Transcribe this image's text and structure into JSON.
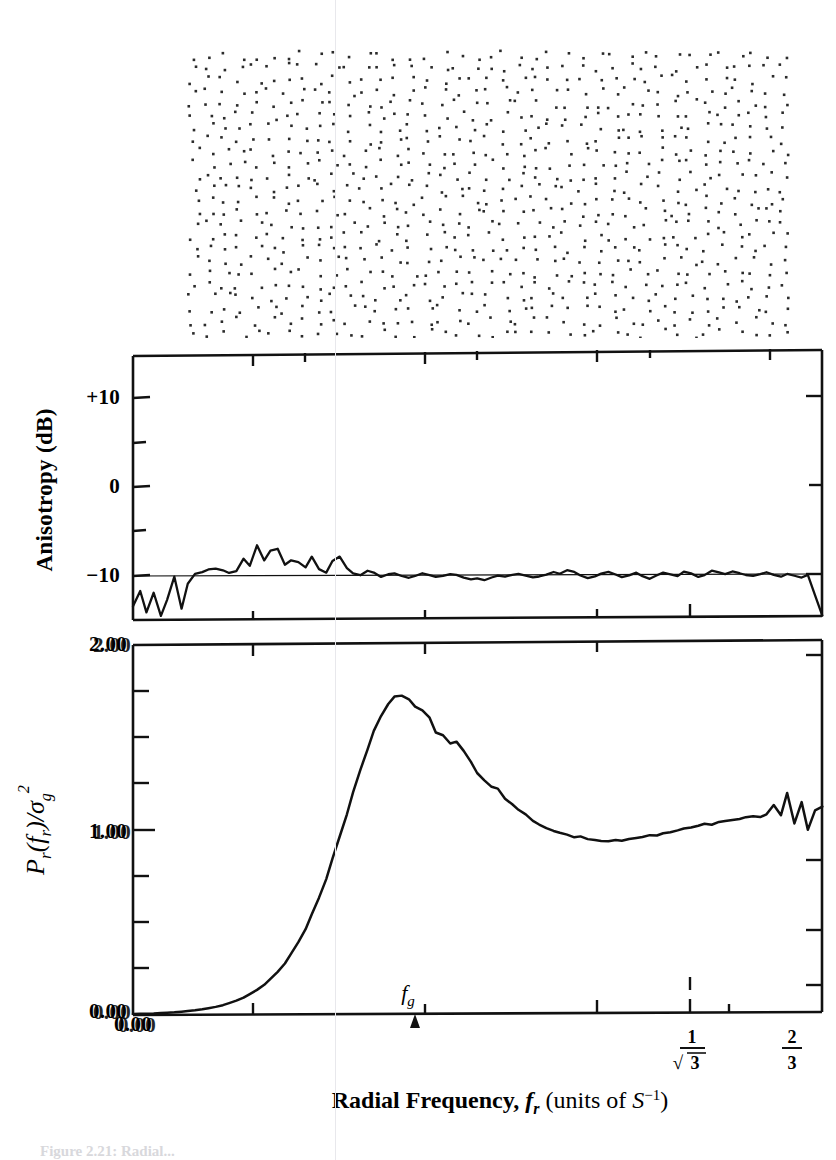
{
  "figure": {
    "caption": "Figure 2.21: Radial...",
    "stipple_panel_name": "jittered-sample-point-pattern"
  },
  "anisotropy_plot": {
    "ylabel": "Anisotropy (dB)",
    "ytick_labels": [
      "+10",
      "0",
      "−10"
    ]
  },
  "spectrum_plot": {
    "ylabel_numerator": "P",
    "ylabel_sub1": "r",
    "ylabel_arg": "(f",
    "ylabel_sub2": "r",
    "ylabel_close": ")/",
    "ylabel_sigma": "σ",
    "ylabel_sigma_sub": "g",
    "ylabel_sigma_sup": "2",
    "ytick_labels": [
      "2.00",
      "1.00",
      "0.00"
    ],
    "marker_label": "f",
    "marker_label_sub": "g",
    "xtick_origin": "0.00",
    "xtick_sqrt3_num": "1",
    "xtick_sqrt3_den": "3",
    "xtick_sqrt3_radical": "√",
    "xtick_twothirds_num": "2",
    "xtick_twothirds_den": "3"
  },
  "xaxis": {
    "label_main": "Radial Frequency, ",
    "label_f": "f",
    "label_f_sub": "r",
    "label_units_open": " (units of ",
    "label_units_S": "S",
    "label_units_sup": "−1",
    "label_units_close": ")"
  },
  "colors": {
    "ink": "#111111",
    "stipple": "#2b2b2b",
    "guide": "#e8e8ec"
  },
  "chart_data": [
    {
      "type": "scatter",
      "name": "jittered-point-pattern",
      "title": "",
      "xlabel": "",
      "ylabel": "",
      "xlim": [
        0,
        1
      ],
      "ylim": [
        0,
        1
      ],
      "grid": false,
      "n_points": 900,
      "description": "Jittered (blue-noise) sample point distribution, roughly uniform density with local regularity"
    },
    {
      "type": "line",
      "name": "anisotropy-spectrum",
      "title": "",
      "xlabel": "Radial Frequency, f_r (units of S^-1)",
      "ylabel": "Anisotropy (dB)",
      "xlim": [
        0,
        0.6667
      ],
      "ylim": [
        -15,
        14
      ],
      "yticks": [
        10,
        5,
        0,
        -5,
        -10
      ],
      "ytick_labels": [
        "+10",
        "",
        "0",
        "",
        "−10"
      ],
      "grid": false,
      "reference_line_y": -10,
      "x": [
        0.0,
        0.007,
        0.013,
        0.02,
        0.027,
        0.033,
        0.04,
        0.047,
        0.053,
        0.06,
        0.067,
        0.073,
        0.08,
        0.087,
        0.093,
        0.1,
        0.107,
        0.113,
        0.12,
        0.127,
        0.133,
        0.14,
        0.147,
        0.153,
        0.16,
        0.167,
        0.173,
        0.18,
        0.187,
        0.193,
        0.2,
        0.207,
        0.213,
        0.22,
        0.227,
        0.233,
        0.24,
        0.247,
        0.253,
        0.26,
        0.267,
        0.273,
        0.28,
        0.287,
        0.293,
        0.3,
        0.307,
        0.313,
        0.32,
        0.327,
        0.333,
        0.34,
        0.347,
        0.353,
        0.36,
        0.367,
        0.373,
        0.38,
        0.387,
        0.393,
        0.4,
        0.407,
        0.413,
        0.42,
        0.427,
        0.433,
        0.44,
        0.447,
        0.453,
        0.46,
        0.467,
        0.473,
        0.48,
        0.487,
        0.493,
        0.5,
        0.507,
        0.513,
        0.52,
        0.527,
        0.533,
        0.54,
        0.547,
        0.553,
        0.56,
        0.567,
        0.573,
        0.58,
        0.587,
        0.593,
        0.6,
        0.607,
        0.613,
        0.62,
        0.627,
        0.633,
        0.64,
        0.647,
        0.653,
        0.66,
        0.667
      ],
      "y": [
        -13.5,
        -11.8,
        -14.2,
        -12.0,
        -14.6,
        -12.8,
        -10.2,
        -13.8,
        -11.0,
        -9.9,
        -9.7,
        -9.4,
        -9.3,
        -9.5,
        -9.8,
        -9.6,
        -8.2,
        -9.0,
        -6.7,
        -8.4,
        -7.3,
        -7.1,
        -8.9,
        -8.4,
        -8.6,
        -9.2,
        -8.0,
        -9.4,
        -9.8,
        -8.5,
        -8.0,
        -9.3,
        -9.9,
        -10.1,
        -9.6,
        -9.8,
        -10.3,
        -10.0,
        -9.9,
        -10.2,
        -10.4,
        -10.2,
        -9.9,
        -10.1,
        -10.3,
        -10.2,
        -10.0,
        -10.1,
        -10.4,
        -10.6,
        -10.5,
        -10.7,
        -10.4,
        -10.2,
        -10.3,
        -10.1,
        -10.0,
        -10.2,
        -10.4,
        -10.3,
        -10.1,
        -9.8,
        -10.0,
        -9.6,
        -9.8,
        -10.2,
        -10.5,
        -10.3,
        -10.0,
        -9.8,
        -10.1,
        -10.4,
        -10.2,
        -9.9,
        -10.3,
        -10.6,
        -10.2,
        -9.9,
        -10.1,
        -10.3,
        -9.8,
        -10.0,
        -10.4,
        -10.2,
        -9.7,
        -9.9,
        -10.1,
        -9.8,
        -10.0,
        -10.2,
        -10.3,
        -10.1,
        -9.9,
        -10.2,
        -10.4,
        -10.1,
        -10.3,
        -10.5,
        -10.2,
        -12.5,
        -14.8
      ]
    },
    {
      "type": "line",
      "name": "radial-power-spectrum",
      "title": "",
      "xlabel": "Radial Frequency, f_r (units of S^-1)",
      "ylabel": "P_r(f_r)/sigma_g^2",
      "xlim": [
        0,
        0.6667
      ],
      "ylim": [
        0,
        2.0
      ],
      "yticks": [
        0.0,
        0.25,
        0.5,
        0.75,
        1.0,
        1.25,
        1.5,
        1.75,
        2.0
      ],
      "ytick_labels": [
        "0.00",
        "",
        "",
        "",
        "1.00",
        "",
        "",
        "",
        "2.00"
      ],
      "xticks": [
        0.0,
        0.1667,
        0.3333,
        0.5,
        0.5774,
        0.6667
      ],
      "xtick_labels": [
        "0.00",
        "",
        "",
        "",
        "1/√3",
        "2/3"
      ],
      "grid": false,
      "marker": {
        "label": "f_g",
        "x": 0.2833
      },
      "x": [
        0.0,
        0.007,
        0.013,
        0.02,
        0.027,
        0.033,
        0.04,
        0.047,
        0.053,
        0.06,
        0.067,
        0.073,
        0.08,
        0.087,
        0.093,
        0.1,
        0.107,
        0.113,
        0.12,
        0.127,
        0.133,
        0.14,
        0.147,
        0.153,
        0.16,
        0.167,
        0.173,
        0.18,
        0.187,
        0.193,
        0.2,
        0.207,
        0.213,
        0.22,
        0.227,
        0.233,
        0.24,
        0.247,
        0.253,
        0.26,
        0.267,
        0.273,
        0.28,
        0.287,
        0.293,
        0.3,
        0.307,
        0.313,
        0.32,
        0.327,
        0.333,
        0.34,
        0.347,
        0.353,
        0.36,
        0.367,
        0.373,
        0.38,
        0.387,
        0.393,
        0.4,
        0.407,
        0.413,
        0.42,
        0.427,
        0.433,
        0.44,
        0.447,
        0.453,
        0.46,
        0.467,
        0.473,
        0.48,
        0.487,
        0.493,
        0.5,
        0.507,
        0.513,
        0.52,
        0.527,
        0.533,
        0.54,
        0.547,
        0.553,
        0.56,
        0.567,
        0.573,
        0.58,
        0.587,
        0.593,
        0.6,
        0.607,
        0.613,
        0.62,
        0.627,
        0.633,
        0.64,
        0.647,
        0.653,
        0.66,
        0.667
      ],
      "y": [
        0.005,
        0.006,
        0.007,
        0.008,
        0.01,
        0.012,
        0.014,
        0.017,
        0.02,
        0.024,
        0.029,
        0.035,
        0.042,
        0.051,
        0.062,
        0.075,
        0.091,
        0.11,
        0.133,
        0.16,
        0.192,
        0.23,
        0.275,
        0.328,
        0.39,
        0.46,
        0.54,
        0.63,
        0.73,
        0.84,
        0.96,
        1.08,
        1.2,
        1.32,
        1.43,
        1.53,
        1.61,
        1.675,
        1.715,
        1.72,
        1.7,
        1.66,
        1.64,
        1.6,
        1.52,
        1.505,
        1.46,
        1.47,
        1.42,
        1.36,
        1.3,
        1.26,
        1.225,
        1.215,
        1.16,
        1.13,
        1.1,
        1.075,
        1.04,
        1.02,
        1.0,
        0.985,
        0.975,
        0.965,
        0.95,
        0.955,
        0.94,
        0.935,
        0.93,
        0.928,
        0.935,
        0.93,
        0.94,
        0.945,
        0.95,
        0.96,
        0.958,
        0.97,
        0.975,
        0.985,
        0.995,
        1.0,
        1.01,
        1.02,
        1.015,
        1.03,
        1.035,
        1.04,
        1.045,
        1.055,
        1.06,
        1.055,
        1.07,
        1.12,
        1.065,
        1.185,
        1.02,
        1.135,
        0.985,
        1.09,
        1.11
      ]
    }
  ]
}
